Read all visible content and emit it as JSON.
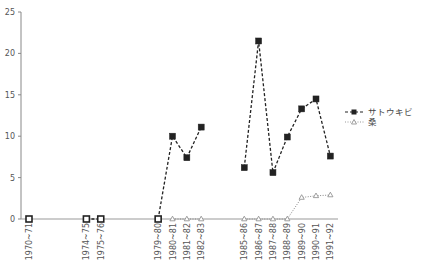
{
  "chart_data": {
    "type": "line",
    "title": "",
    "xlabel": "",
    "ylabel": "",
    "ylim": [
      0,
      25
    ],
    "yticks": [
      0,
      5,
      10,
      15,
      20,
      25
    ],
    "grid": false,
    "legend_position": "right",
    "x_positions": {
      "1970~71": 0,
      "1974~75": 4,
      "1975~76": 5,
      "1979~80": 9,
      "1980~81": 10,
      "1981~82": 11,
      "1982~83": 12,
      "1985~86": 15,
      "1986~87": 16,
      "1987~88": 17,
      "1988~89": 18,
      "1989~90": 19,
      "1990~91": 20,
      "1991~92": 21
    },
    "categories": [
      "1970~71",
      "1974~75",
      "1975~76",
      "1979~80",
      "1980~81",
      "1981~82",
      "1982~83",
      "1985~86",
      "1986~87",
      "1987~88",
      "1988~89",
      "1989~90",
      "1990~91",
      "1991~92"
    ],
    "series": [
      {
        "name": "サトウキビ",
        "style": "dashed",
        "marker": "square-filled",
        "color": "#222222",
        "segments": [
          [
            [
              "1970~71",
              0
            ]
          ],
          [
            [
              "1974~75",
              0
            ],
            [
              "1975~76",
              0
            ]
          ],
          [
            [
              "1979~80",
              0
            ],
            [
              "1980~81",
              10.0
            ],
            [
              "1981~82",
              7.4
            ],
            [
              "1982~83",
              11.1
            ]
          ],
          [
            [
              "1985~86",
              6.2
            ],
            [
              "1986~87",
              21.5
            ],
            [
              "1987~88",
              5.6
            ],
            [
              "1988~89",
              9.9
            ],
            [
              "1989~90",
              13.3
            ],
            [
              "1990~91",
              14.5
            ],
            [
              "1991~92",
              7.6
            ]
          ]
        ]
      },
      {
        "name": "桑",
        "style": "dotted",
        "marker": "triangle-open",
        "color": "#888888",
        "segments": [
          [
            [
              "1980~81",
              0
            ],
            [
              "1981~82",
              0
            ],
            [
              "1982~83",
              0
            ]
          ],
          [
            [
              "1985~86",
              0
            ],
            [
              "1986~87",
              0
            ],
            [
              "1987~88",
              0
            ],
            [
              "1988~89",
              0
            ],
            [
              "1989~90",
              2.6
            ],
            [
              "1990~91",
              2.8
            ],
            [
              "1991~92",
              2.9
            ]
          ]
        ]
      }
    ]
  },
  "legend": {
    "items": [
      {
        "label": "サトウキビ"
      },
      {
        "label": "桑"
      }
    ]
  }
}
